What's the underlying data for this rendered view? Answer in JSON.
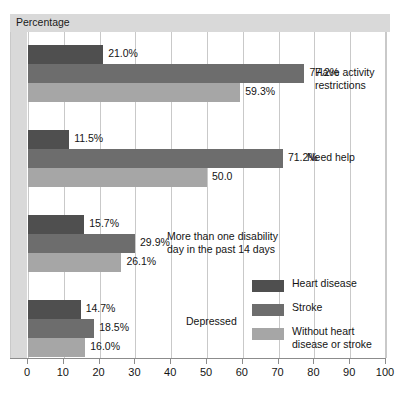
{
  "chart_data": {
    "type": "bar",
    "orientation": "horizontal",
    "title": "Percentage",
    "xlabel": "Percentage",
    "ylabel": "",
    "xlim": [
      0,
      100
    ],
    "xticks": [
      "0",
      "10",
      "20",
      "30",
      "40",
      "50",
      "60",
      "70",
      "80",
      "90",
      "100"
    ],
    "grid": true,
    "legend_position": "inside-bottom-right",
    "categories": [
      "Have activity restrictions",
      "Need help",
      "More than one disability day in the past 14 days",
      "Depressed"
    ],
    "category_labels": [
      "Have activity\nrestrictions",
      "Need help",
      "More than one disability\nday in the past 14 days",
      "Depressed"
    ],
    "series": [
      {
        "name": "Heart disease",
        "color": "#4f4f4f",
        "values": [
          21.0,
          11.5,
          15.7,
          14.7
        ],
        "labels": [
          "21.0%",
          "11.5%",
          "15.7%",
          "14.7%"
        ]
      },
      {
        "name": "Stroke",
        "color": "#6d6d6d",
        "values": [
          77.2,
          71.2,
          29.9,
          18.5
        ],
        "labels": [
          "77.2%",
          "71.2%",
          "29.9%",
          "18.5%"
        ]
      },
      {
        "name": "Without heart disease or stroke",
        "color": "#a6a6a6",
        "values": [
          59.3,
          50.0,
          26.1,
          16.0
        ],
        "labels": [
          "59.3%",
          "50.0",
          "26.1%",
          "16.0%"
        ]
      }
    ]
  },
  "legend": {
    "entries": [
      {
        "label": "Heart disease"
      },
      {
        "label": "Stroke"
      },
      {
        "label": "Without heart\ndisease or stroke"
      }
    ]
  },
  "colors": {
    "series_1": "#4f4f4f",
    "series_2": "#6d6d6d",
    "series_3": "#a6a6a6",
    "header_band": "#d9d9d9",
    "gridline": "#c9c9c9",
    "axis": "#8c8c8c"
  }
}
